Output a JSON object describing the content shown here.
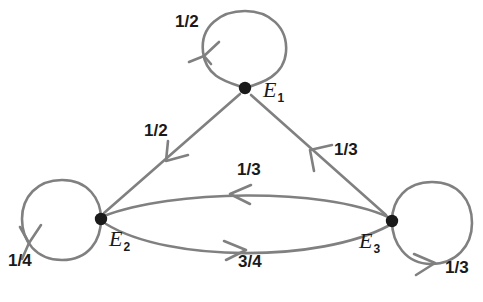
{
  "diagram": {
    "type": "markov-chain-state-transition-graph",
    "stroke_color": "#808080",
    "node_color": "#1a1a1a",
    "text_color": "#1a1a1a",
    "background_color": "#ffffff",
    "states": [
      {
        "id": "E1",
        "label": "E",
        "subscript": "1",
        "x": 245,
        "y": 88
      },
      {
        "id": "E2",
        "label": "E",
        "subscript": "2",
        "x": 101,
        "y": 219
      },
      {
        "id": "E3",
        "label": "E",
        "subscript": "3",
        "x": 392,
        "y": 221
      }
    ],
    "transitions": [
      {
        "id": "E1-E1",
        "from": "E1",
        "to": "E1",
        "weight": "1/2",
        "kind": "self-loop",
        "label_x": 175,
        "label_y": 13
      },
      {
        "id": "E1-E2",
        "from": "E1",
        "to": "E2",
        "weight": "1/2",
        "kind": "straight",
        "label_x": 144,
        "label_y": 122
      },
      {
        "id": "E2-E2",
        "from": "E2",
        "to": "E2",
        "weight": "1/4",
        "kind": "self-loop",
        "label_x": 8,
        "label_y": 252
      },
      {
        "id": "E2-E3",
        "from": "E2",
        "to": "E3",
        "weight": "3/4",
        "kind": "curve",
        "label_x": 238,
        "label_y": 253
      },
      {
        "id": "E3-E1",
        "from": "E3",
        "to": "E1",
        "weight": "1/3",
        "kind": "straight",
        "label_x": 334,
        "label_y": 141
      },
      {
        "id": "E3-E2",
        "from": "E3",
        "to": "E2",
        "weight": "1/3",
        "kind": "curve",
        "label_x": 237,
        "label_y": 161
      },
      {
        "id": "E3-E3",
        "from": "E3",
        "to": "E3",
        "weight": "1/3",
        "kind": "self-loop",
        "label_x": 445,
        "label_y": 259
      }
    ]
  }
}
